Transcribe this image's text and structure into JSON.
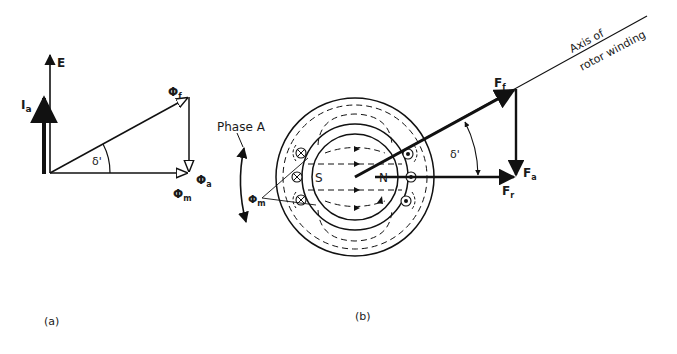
{
  "figure": {
    "panel_a": {
      "caption": "(a)",
      "labels": {
        "E": "E",
        "Ia_main": "I",
        "Ia_sub": "a",
        "phi_f_main": "Φ",
        "phi_f_sub": "f",
        "phi_a_main": "Φ",
        "phi_a_sub": "a",
        "phi_m_main": "Φ",
        "phi_m_sub": "m",
        "delta": "δ'"
      }
    },
    "panel_b": {
      "caption": "(b)",
      "labels": {
        "phase_a": "Phase A",
        "phi_m_main": "Φ",
        "phi_m_sub": "m",
        "south": "S",
        "north": "N",
        "axis_line1": "Axis of",
        "axis_line2": "rotor winding",
        "Ff_main": "F",
        "Ff_sub": "f",
        "Fa_main": "F",
        "Fa_sub": "a",
        "Fr_main": "F",
        "Fr_sub": "r",
        "delta": "δ'"
      }
    }
  }
}
